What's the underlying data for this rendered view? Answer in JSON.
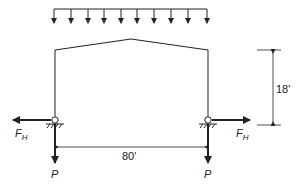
{
  "diagram": {
    "type": "gable-frame-structural-diagram",
    "load": {
      "kind": "uniform-distributed-load",
      "arrow_count": 10
    },
    "labels": {
      "height_dim": "18'",
      "span_dim": "80'",
      "horizontal_force": "F",
      "horizontal_force_sub": "H",
      "vertical_force": "P"
    },
    "colors": {
      "line": "#222222",
      "background": "#ffffff"
    }
  }
}
